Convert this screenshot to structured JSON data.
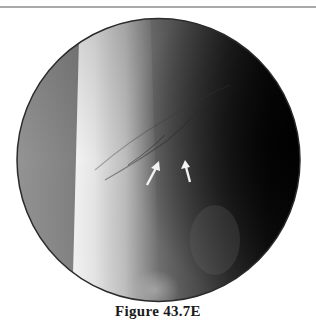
{
  "figure": {
    "caption": "Figure 43.7E",
    "image_type": "circular fluoroscopic radiograph",
    "annotations": {
      "arrows": [
        {
          "name": "left-arrow",
          "direction": "up-right",
          "tip": [
            158,
            163
          ],
          "tail": [
            147,
            185
          ]
        },
        {
          "name": "right-arrow",
          "direction": "up",
          "tip": [
            185,
            161
          ],
          "tail": [
            190,
            182
          ]
        }
      ],
      "arrow_color": "#f2f2f2"
    },
    "colors": {
      "rule": "#a9a9a9",
      "circle_border": "#2b2b2b",
      "bone": "#e8e8e8",
      "soft_tissue_dark": "#0a0a0a"
    }
  }
}
